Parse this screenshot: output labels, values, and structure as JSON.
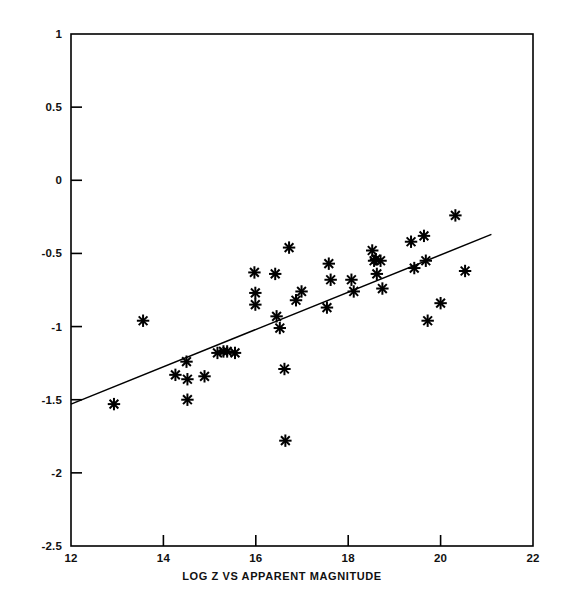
{
  "chart_data": {
    "type": "scatter",
    "title": "",
    "xlabel": "LOG Z VS APPARENT MAGNITUDE",
    "ylabel": "",
    "xlim": [
      12,
      22
    ],
    "ylim": [
      -2.5,
      1
    ],
    "xticks": [
      12,
      14,
      16,
      18,
      20,
      22
    ],
    "yticks": [
      1,
      0.5,
      0,
      -0.5,
      -1,
      -1.5,
      -2,
      -2.5
    ],
    "xtick_labels": [
      "12",
      "14",
      "16",
      "18",
      "20",
      "22"
    ],
    "ytick_labels": [
      "1",
      "0.5",
      "0",
      "-0.5",
      "-1",
      "-1.5",
      "-2",
      "-2.5"
    ],
    "grid": false,
    "legend": null,
    "marker": "asterisk",
    "marker_color": "#000000",
    "line_color": "#000000",
    "points": [
      {
        "x": 12.93,
        "y": -1.53
      },
      {
        "x": 13.56,
        "y": -0.96
      },
      {
        "x": 14.26,
        "y": -1.33
      },
      {
        "x": 14.5,
        "y": -1.24
      },
      {
        "x": 14.52,
        "y": -1.36
      },
      {
        "x": 14.52,
        "y": -1.5
      },
      {
        "x": 14.89,
        "y": -1.34
      },
      {
        "x": 15.17,
        "y": -1.18
      },
      {
        "x": 15.3,
        "y": -1.17
      },
      {
        "x": 15.38,
        "y": -1.17
      },
      {
        "x": 15.55,
        "y": -1.18
      },
      {
        "x": 15.97,
        "y": -0.63
      },
      {
        "x": 15.99,
        "y": -0.77
      },
      {
        "x": 15.99,
        "y": -0.85
      },
      {
        "x": 16.42,
        "y": -0.64
      },
      {
        "x": 16.45,
        "y": -0.93
      },
      {
        "x": 16.52,
        "y": -1.01
      },
      {
        "x": 16.62,
        "y": -1.29
      },
      {
        "x": 16.64,
        "y": -1.78
      },
      {
        "x": 16.72,
        "y": -0.46
      },
      {
        "x": 16.87,
        "y": -0.82
      },
      {
        "x": 16.99,
        "y": -0.76
      },
      {
        "x": 17.54,
        "y": -0.87
      },
      {
        "x": 17.58,
        "y": -0.57
      },
      {
        "x": 17.62,
        "y": -0.68
      },
      {
        "x": 18.07,
        "y": -0.68
      },
      {
        "x": 18.12,
        "y": -0.76
      },
      {
        "x": 18.52,
        "y": -0.48
      },
      {
        "x": 18.56,
        "y": -0.55
      },
      {
        "x": 18.6,
        "y": -0.54
      },
      {
        "x": 18.62,
        "y": -0.64
      },
      {
        "x": 18.7,
        "y": -0.55
      },
      {
        "x": 18.74,
        "y": -0.74
      },
      {
        "x": 19.36,
        "y": -0.42
      },
      {
        "x": 19.43,
        "y": -0.6
      },
      {
        "x": 19.64,
        "y": -0.38
      },
      {
        "x": 19.68,
        "y": -0.55
      },
      {
        "x": 19.72,
        "y": -0.96
      },
      {
        "x": 20.0,
        "y": -0.84
      },
      {
        "x": 20.32,
        "y": -0.24
      },
      {
        "x": 20.53,
        "y": -0.62
      }
    ],
    "fit_line": {
      "x_start": 12.0,
      "y_start": -1.53,
      "x_end": 21.1,
      "y_end": -0.37
    }
  }
}
